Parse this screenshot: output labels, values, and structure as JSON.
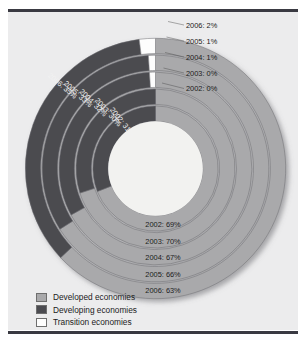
{
  "chart_data": {
    "type": "pie",
    "variant": "concentric-donut",
    "title": "",
    "subtitle": "",
    "xlabel": "",
    "ylabel": "",
    "grid": false,
    "legend_position": "bottom-left",
    "rings_order": "innermost-to-outermost",
    "categories": [
      "Developed economies",
      "Developing economies",
      "Transition economies"
    ],
    "colors": {
      "developed": "#a9a9ab",
      "developing": "#4b4b50",
      "transition": "#fdfdfd",
      "panel_background": "#ececed",
      "hole": "#f2f2f0",
      "rule": "#3a3a42"
    },
    "rings": [
      {
        "year": "2002",
        "index": 0,
        "values": {
          "developed": 69,
          "developing": 31,
          "transition": 0
        },
        "labels": {
          "developed": "2002: 69%",
          "developing": "2002: 31%",
          "transition": "2002: 0%"
        }
      },
      {
        "year": "2003",
        "index": 1,
        "values": {
          "developed": 70,
          "developing": 30,
          "transition": 0
        },
        "labels": {
          "developed": "2003: 70%",
          "developing": "2003: 30%",
          "transition": "2003: 0%"
        }
      },
      {
        "year": "2004",
        "index": 2,
        "values": {
          "developed": 67,
          "developing": 32,
          "transition": 1
        },
        "labels": {
          "developed": "2004: 67%",
          "developing": "2004: 32%",
          "transition": "2004: 1%"
        }
      },
      {
        "year": "2005",
        "index": 3,
        "values": {
          "developed": 66,
          "developing": 33,
          "transition": 1
        },
        "labels": {
          "developed": "2005: 66%",
          "developing": "2005: 33%",
          "transition": "2005: 1%"
        }
      },
      {
        "year": "2006",
        "index": 4,
        "values": {
          "developed": 63,
          "developing": 35,
          "transition": 2
        },
        "labels": {
          "developed": "2006: 63%",
          "developing": "2006: 35%",
          "transition": "2006: 2%"
        }
      }
    ],
    "transition_labels_top": [
      "2006: 2%",
      "2005: 1%",
      "2004: 1%",
      "2003: 0%",
      "2002: 0%"
    ],
    "developed_labels_bottom": [
      "2002: 69%",
      "2003: 70%",
      "2004: 67%",
      "2005: 66%",
      "2006: 63%"
    ],
    "developing_labels_left": [
      "2006: 35%",
      "2005: 33%",
      "2004: 32%",
      "2003: 30%",
      "2002: 31%"
    ]
  },
  "legend": {
    "items": [
      {
        "label": "Developed economies",
        "color": "#a9a9ab"
      },
      {
        "label": "Developing economies",
        "color": "#4b4b50"
      },
      {
        "label": "Transition economies",
        "color": "#fdfdfd"
      }
    ]
  }
}
